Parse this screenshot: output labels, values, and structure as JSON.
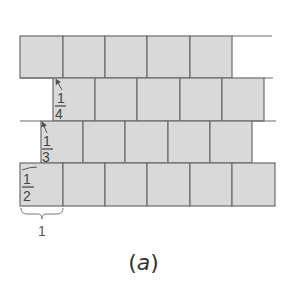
{
  "figure": {
    "caption_open": "(",
    "caption_letter": "a",
    "caption_close": ")",
    "unit_label": "1",
    "colors": {
      "brick_fill": "#d9d9d9",
      "brick_stroke": "#6b6b6b",
      "text": "#444444"
    }
  },
  "rows": [
    {
      "name": "row-1",
      "offset_label": null,
      "cells": 5,
      "x_start": 20,
      "y": 36,
      "line_end": 272
    },
    {
      "name": "row-2",
      "offset_label": {
        "num": "1",
        "den": "4"
      },
      "cells": 5,
      "x_start": 53,
      "y": 78,
      "line_end": 273
    },
    {
      "name": "row-3",
      "offset_label": {
        "num": "1",
        "den": "3"
      },
      "cells": 5,
      "x_start": 41,
      "y": 121,
      "line_end": 276
    },
    {
      "name": "row-4",
      "offset_label": {
        "num": "1",
        "den": "2"
      },
      "cells": 6,
      "x_start": 20,
      "y": 163,
      "line_end": 275
    }
  ],
  "labels": {
    "quarter_num": "1",
    "quarter_den": "4",
    "third_num": "1",
    "third_den": "3",
    "half_num": "1",
    "half_den": "2"
  }
}
